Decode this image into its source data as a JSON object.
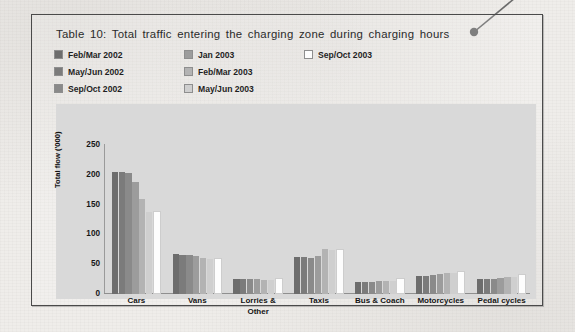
{
  "document": {
    "page_background": "#efedea",
    "frame_border_color": "#4a4a4a"
  },
  "callout": {
    "name": "callout-leader-line",
    "dot_color": "#6b6b6b",
    "line_color": "#6b6b6b"
  },
  "figure": {
    "title": "Table 10: Total traffic  entering the charging zone during charging hours"
  },
  "legend": {
    "columns": [
      {
        "items": [
          {
            "label": "Feb/Mar 2002",
            "color": "#6d6d6d"
          },
          {
            "label": "May/Jun 2002",
            "color": "#7b7b7b"
          },
          {
            "label": "Sep/Oct 2002",
            "color": "#8a8a8a"
          }
        ]
      },
      {
        "items": [
          {
            "label": "Jan 2003",
            "color": "#9c9c9c"
          },
          {
            "label": "Feb/Mar 2003",
            "color": "#b3b3b3"
          },
          {
            "label": "May/Jun 2003",
            "color": "#cfcfcf"
          }
        ]
      },
      {
        "items": [
          {
            "label": "Sep/Oct 2003",
            "color": "#fdfdfd"
          }
        ]
      }
    ]
  },
  "chart_data": {
    "type": "bar",
    "title": "Table 10: Total traffic  entering the charging zone during charging hours",
    "xlabel": "",
    "ylabel": "Total flow ('000)",
    "ylim": [
      0,
      250
    ],
    "yticks": [
      0,
      50,
      100,
      150,
      200,
      250
    ],
    "grid": false,
    "legend_position": "top-left",
    "plot_background": "#d9d9d9",
    "categories": [
      "Cars",
      "Vans",
      "Lorries &\nOther",
      "Taxis",
      "Bus & Coach",
      "Motorcycles",
      "Pedal cycles"
    ],
    "category_labels": [
      "Cars",
      "Vans",
      "Lorries &",
      "Taxis",
      "Bus & Coach",
      "Motorcycles",
      "Pedal cycles"
    ],
    "category_label_line2": [
      "",
      "",
      "Other",
      "",
      "",
      "",
      ""
    ],
    "series": [
      {
        "name": "Feb/Mar 2002",
        "color": "#6d6d6d",
        "values": [
          205,
          67,
          25,
          62,
          20,
          30,
          25
        ]
      },
      {
        "name": "May/Jun 2002",
        "color": "#7b7b7b",
        "values": [
          204,
          66,
          25,
          62,
          20,
          31,
          26
        ]
      },
      {
        "name": "Sep/Oct 2002",
        "color": "#8a8a8a",
        "values": [
          203,
          65,
          25,
          61,
          20,
          32,
          26
        ]
      },
      {
        "name": "Jan 2003",
        "color": "#9c9c9c",
        "values": [
          188,
          63,
          25,
          63,
          21,
          34,
          27
        ]
      },
      {
        "name": "Feb/Mar 2003",
        "color": "#b3b3b3",
        "values": [
          160,
          60,
          24,
          75,
          22,
          36,
          29
        ]
      },
      {
        "name": "May/Jun 2003",
        "color": "#cfcfcf",
        "values": [
          137,
          58,
          24,
          74,
          22,
          35,
          29
        ]
      },
      {
        "name": "Sep/Oct 2003",
        "color": "#fdfdfd",
        "values": [
          136,
          57,
          24,
          73,
          23,
          35,
          30
        ]
      }
    ]
  }
}
